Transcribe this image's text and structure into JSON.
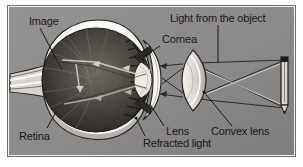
{
  "figure": {
    "type": "diagram",
    "background_color": "#8e8e8c",
    "frame_color": "#f3f2ee",
    "frame_border_color": "#6f6f6d",
    "ink_color": "#17181a",
    "label_font_size": 11,
    "labels": {
      "image": "Image",
      "retina": "Retina",
      "cornea": "Cornea",
      "light_from_object": "Light from the object",
      "lens": "Lens",
      "refracted_light": "Refracted light",
      "convex_lens": "Convex lens"
    },
    "parts": [
      {
        "name": "image",
        "label": "Image",
        "position": "top-left"
      },
      {
        "name": "retina",
        "label": "Retina",
        "position": "bottom-left"
      },
      {
        "name": "cornea",
        "label": "Cornea",
        "position": "top-center"
      },
      {
        "name": "light-from-the-object",
        "label": "Light from the object",
        "position": "top-right"
      },
      {
        "name": "lens",
        "label": "Lens",
        "position": "bottom-center"
      },
      {
        "name": "refracted-light",
        "label": "Refracted light",
        "position": "bottom-center"
      },
      {
        "name": "convex-lens",
        "label": "Convex lens",
        "position": "bottom-right"
      }
    ]
  }
}
